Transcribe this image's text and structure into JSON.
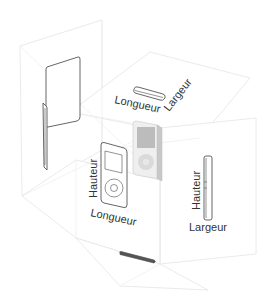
{
  "diagram": {
    "labels": {
      "top_length": "Longueur",
      "top_width": "Largeur",
      "front_height": "Hauteur",
      "front_length": "Longueur",
      "side_height": "Hauteur",
      "side_width": "Largeur"
    },
    "colors": {
      "plane_stroke": "#e4e4e4",
      "outline": "#555555",
      "device_shade": "#bdbdbd",
      "text": "#333333"
    }
  }
}
